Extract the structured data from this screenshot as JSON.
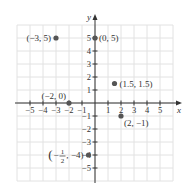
{
  "chart_data": {
    "type": "scatter",
    "title": "",
    "xlabel": "x",
    "ylabel": "y",
    "xlim": [
      -6,
      6
    ],
    "ylim": [
      -6,
      6
    ],
    "grid": true,
    "legend": null,
    "x_ticks": [
      -5,
      -4,
      -3,
      -2,
      -1,
      1,
      2,
      3,
      4,
      5
    ],
    "y_ticks": [
      -5,
      -4,
      -3,
      -2,
      -1,
      1,
      2,
      3,
      4,
      5
    ],
    "x_tick_labels": [
      "−5",
      "−4",
      "−3",
      "−2",
      "−1",
      "1",
      "2",
      "3",
      "4",
      "5"
    ],
    "y_tick_labels": [
      "−5",
      "−4",
      "−3",
      "−2",
      "−1",
      "1",
      "2",
      "3",
      "4",
      "5"
    ],
    "points": [
      {
        "x": -3,
        "y": 5,
        "label": "(−3, 5)"
      },
      {
        "x": 0,
        "y": 5,
        "label": "(0, 5)"
      },
      {
        "x": 1.5,
        "y": 1.5,
        "label": "(1.5, 1.5)"
      },
      {
        "x": -2,
        "y": 0,
        "label": "(−2, 0)"
      },
      {
        "x": 2,
        "y": -1,
        "label": "(2, −1)"
      },
      {
        "x": -0.5,
        "y": -4,
        "label": "(−1/2, −4)"
      }
    ],
    "colors": {
      "grid": "#e2e2e2",
      "axis": "#333333",
      "point": "#555555",
      "text": "#333333"
    }
  }
}
